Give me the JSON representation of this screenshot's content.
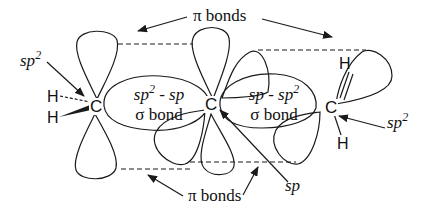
{
  "labels": {
    "pi_bonds_top": "π bonds",
    "pi_bonds_bottom": "π bonds",
    "sp2_left": {
      "base": "sp",
      "sup": "2"
    },
    "sp2_right": {
      "base": "sp",
      "sup": "2"
    },
    "sp_bottom": "sp",
    "sigma_left": {
      "line1_a": "sp",
      "line1_sup": "2",
      "line1_b": " - sp",
      "line2": "σ bond"
    },
    "sigma_right": {
      "line1_a": "sp - sp",
      "line1_sup": "2",
      "line2": "σ bond"
    }
  },
  "atoms": {
    "c_left": "C",
    "c_center": "C",
    "c_right": "C",
    "h_left_top": "H",
    "h_left_bottom": "H",
    "h_right_top": "H",
    "h_right_bottom": "H"
  },
  "colors": {
    "stroke": "#1a1a1a",
    "background": "#ffffff"
  }
}
